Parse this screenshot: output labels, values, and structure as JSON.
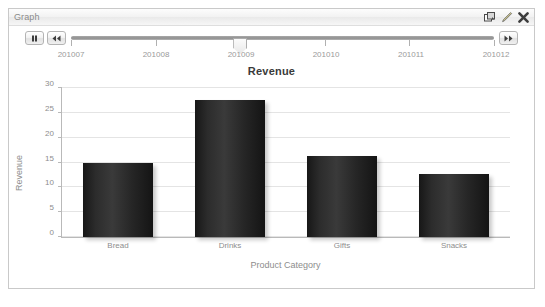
{
  "window": {
    "title": "Graph",
    "icons": [
      {
        "name": "duplicate-icon",
        "label": "Duplicate"
      },
      {
        "name": "edit-pencil-icon",
        "label": "Edit"
      },
      {
        "name": "close-icon",
        "label": "Close"
      }
    ]
  },
  "timeline": {
    "pause_label": "Pause",
    "rewind_label": "Rewind",
    "forward_label": "Forward",
    "ticks": [
      "201007",
      "201008",
      "201009",
      "201010",
      "201011",
      "201012"
    ],
    "current_value": "201009",
    "thumb_index": 2
  },
  "chart_data": {
    "type": "bar",
    "title": "Revenue",
    "xlabel": "Product Category",
    "ylabel": "Revenue",
    "categories": [
      "Bread",
      "Drinks",
      "Gifts",
      "Snacks"
    ],
    "values": [
      15,
      27.5,
      16.3,
      12.7
    ],
    "yticks": [
      0,
      5,
      10,
      15,
      20,
      25,
      30
    ],
    "ylim": [
      0,
      30
    ],
    "grid": true,
    "legend": "none",
    "bar_color": "#2b2b2b",
    "grid_color": "#e4e4e4",
    "axis_color": "#b9b9b9",
    "text_color": "#8d8d8d"
  }
}
